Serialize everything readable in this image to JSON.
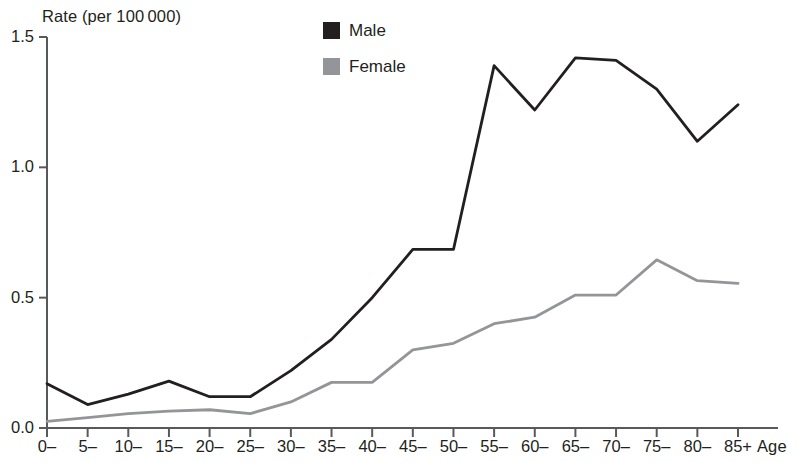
{
  "chart_data": {
    "type": "line",
    "title": "",
    "ylabel": "Rate (per 100 000)",
    "xlabel": "Age",
    "categories": [
      "0–",
      "5–",
      "10–",
      "15–",
      "20–",
      "25–",
      "30–",
      "35–",
      "40–",
      "45–",
      "50–",
      "55–",
      "60–",
      "65–",
      "70–",
      "75–",
      "80–",
      "85+"
    ],
    "series": [
      {
        "name": "Male",
        "color": "#231f20",
        "values": [
          0.17,
          0.09,
          0.13,
          0.18,
          0.12,
          0.12,
          0.22,
          0.34,
          0.5,
          0.685,
          0.685,
          1.39,
          1.22,
          1.42,
          1.41,
          1.3,
          1.1,
          1.24
        ]
      },
      {
        "name": "Female",
        "color": "#939598",
        "values": [
          0.025,
          0.04,
          0.055,
          0.065,
          0.07,
          0.055,
          0.1,
          0.175,
          0.175,
          0.3,
          0.325,
          0.4,
          0.425,
          0.51,
          0.51,
          0.645,
          0.565,
          0.555
        ]
      }
    ],
    "ylim": [
      0.0,
      1.5
    ],
    "ytick_labels": [
      "0.0",
      "0.5",
      "1.0",
      "1.5"
    ],
    "ytick_values": [
      0.0,
      0.5,
      1.0,
      1.5
    ],
    "grid": false,
    "legend_position": "top-center"
  },
  "legend": {
    "items": [
      {
        "label": "Male",
        "color": "#231f20",
        "swatch": "male-swatch"
      },
      {
        "label": "Female",
        "color": "#939598",
        "swatch": "female-swatch"
      }
    ]
  }
}
